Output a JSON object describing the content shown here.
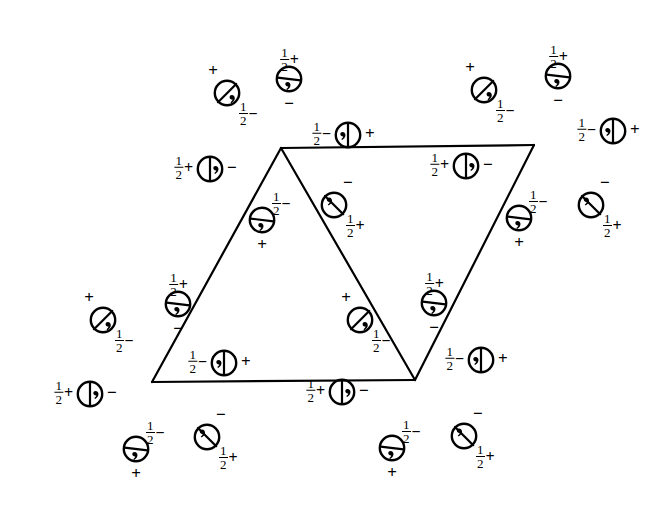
{
  "figure": {
    "kind": "crystallographic-space-group-general-position-diagram",
    "background_color": "#ffffff",
    "ink_color": "#000000",
    "cell_outline": {
      "shape": "two-triangles-forming-rhombus",
      "stroke_width": 2.2,
      "vertices": {
        "top_left": {
          "x": 281,
          "y": 148
        },
        "top_right": {
          "x": 534,
          "y": 145
        },
        "bottom_left": {
          "x": 152,
          "y": 382
        },
        "bottom_mid": {
          "x": 415,
          "y": 380
        }
      },
      "edges": [
        {
          "name": "top-edge",
          "from": "top_left",
          "to": "top_right"
        },
        {
          "name": "left-edge",
          "from": "top_left",
          "to": "bottom_left"
        },
        {
          "name": "bottom-edge",
          "from": "bottom_left",
          "to": "bottom_mid"
        },
        {
          "name": "inner-diagonal",
          "from": "top_left",
          "to": "bottom_mid"
        },
        {
          "name": "right-edge",
          "from": "top_right",
          "to": "bottom_mid"
        }
      ]
    },
    "glyph_legend": {
      "circle-split-vertical-comma-right": "circle divided by a vertical chord, comma mark in right half",
      "circle-split-vertical-comma-left": "circle divided by a vertical chord, comma mark in left half",
      "circle-split-horizontal-comma-below": "circle divided by a horizontal chord, comma mark below the chord",
      "circle-split-diagonal-nesw-comma-lower-right": "circle divided by a diagonal chord running upper-right to lower-left, comma in lower-right",
      "circle-split-diagonal-nwse-comma-upper-left": "circle divided by a diagonal chord running upper-left to lower-right, comma in upper-left"
    },
    "labels": {
      "plus": "+",
      "minus": "−",
      "half_numerator": "1",
      "half_denominator": "2",
      "half_plus_suffix": "+",
      "half_minus_suffix": "−"
    },
    "sites": [
      {
        "id": "s01",
        "x": 289,
        "y": 79,
        "glyph": "circle-split-horizontal-comma-below",
        "marks": [
          {
            "pos": "n",
            "type": "half-plus"
          },
          {
            "pos": "s",
            "type": "minus"
          }
        ]
      },
      {
        "id": "s02",
        "x": 227,
        "y": 93,
        "glyph": "circle-split-diagonal-nesw-comma-lower-right",
        "marks": [
          {
            "pos": "nw",
            "type": "plus"
          },
          {
            "pos": "se",
            "type": "half-minus"
          }
        ]
      },
      {
        "id": "s03",
        "x": 558,
        "y": 76,
        "glyph": "circle-split-horizontal-comma-below",
        "marks": [
          {
            "pos": "n",
            "type": "half-plus"
          },
          {
            "pos": "s",
            "type": "minus"
          }
        ]
      },
      {
        "id": "s04",
        "x": 484,
        "y": 90,
        "glyph": "circle-split-diagonal-nesw-comma-lower-right",
        "marks": [
          {
            "pos": "nw",
            "type": "plus"
          },
          {
            "pos": "se",
            "type": "half-minus"
          }
        ]
      },
      {
        "id": "s05",
        "x": 348,
        "y": 135,
        "glyph": "circle-split-vertical-comma-left",
        "marks": [
          {
            "pos": "w",
            "type": "half-minus"
          },
          {
            "pos": "e",
            "type": "plus"
          }
        ]
      },
      {
        "id": "s06",
        "x": 613,
        "y": 131,
        "glyph": "circle-split-vertical-comma-left",
        "marks": [
          {
            "pos": "w",
            "type": "half-minus"
          },
          {
            "pos": "e",
            "type": "plus"
          }
        ]
      },
      {
        "id": "s07",
        "x": 210,
        "y": 169,
        "glyph": "circle-split-vertical-comma-right",
        "marks": [
          {
            "pos": "w",
            "type": "half-plus"
          },
          {
            "pos": "e",
            "type": "minus"
          }
        ]
      },
      {
        "id": "s08",
        "x": 466,
        "y": 166,
        "glyph": "circle-split-vertical-comma-right",
        "marks": [
          {
            "pos": "w",
            "type": "half-plus"
          },
          {
            "pos": "e",
            "type": "minus"
          }
        ]
      },
      {
        "id": "s09",
        "x": 262,
        "y": 220,
        "glyph": "circle-split-horizontal-comma-below",
        "marks": [
          {
            "pos": "ne",
            "type": "half-minus"
          },
          {
            "pos": "s",
            "type": "plus"
          }
        ]
      },
      {
        "id": "s10",
        "x": 334,
        "y": 205,
        "glyph": "circle-split-diagonal-nwse-comma-upper-left",
        "marks": [
          {
            "pos": "ne",
            "type": "minus"
          },
          {
            "pos": "se",
            "type": "half-plus"
          }
        ]
      },
      {
        "id": "s11",
        "x": 519,
        "y": 218,
        "glyph": "circle-split-horizontal-comma-below",
        "marks": [
          {
            "pos": "ne",
            "type": "half-minus"
          },
          {
            "pos": "s",
            "type": "plus"
          }
        ]
      },
      {
        "id": "s12",
        "x": 591,
        "y": 205,
        "glyph": "circle-split-diagonal-nwse-comma-upper-left",
        "marks": [
          {
            "pos": "ne",
            "type": "minus"
          },
          {
            "pos": "se",
            "type": "half-plus"
          }
        ]
      },
      {
        "id": "s13",
        "x": 178,
        "y": 304,
        "glyph": "circle-split-horizontal-comma-below",
        "marks": [
          {
            "pos": "n",
            "type": "half-plus"
          },
          {
            "pos": "s",
            "type": "minus"
          }
        ]
      },
      {
        "id": "s14",
        "x": 103,
        "y": 320,
        "glyph": "circle-split-diagonal-nesw-comma-lower-right",
        "marks": [
          {
            "pos": "nw",
            "type": "plus"
          },
          {
            "pos": "se",
            "type": "half-minus"
          }
        ]
      },
      {
        "id": "s15",
        "x": 434,
        "y": 303,
        "glyph": "circle-split-horizontal-comma-below",
        "marks": [
          {
            "pos": "n",
            "type": "half-plus"
          },
          {
            "pos": "s",
            "type": "minus"
          }
        ]
      },
      {
        "id": "s16",
        "x": 360,
        "y": 320,
        "glyph": "circle-split-diagonal-nesw-comma-lower-right",
        "marks": [
          {
            "pos": "nw",
            "type": "plus"
          },
          {
            "pos": "se",
            "type": "half-minus"
          }
        ]
      },
      {
        "id": "s17",
        "x": 224,
        "y": 363,
        "glyph": "circle-split-vertical-comma-left",
        "marks": [
          {
            "pos": "w",
            "type": "half-minus"
          },
          {
            "pos": "e",
            "type": "plus"
          }
        ]
      },
      {
        "id": "s18",
        "x": 481,
        "y": 360,
        "glyph": "circle-split-vertical-comma-left",
        "marks": [
          {
            "pos": "w",
            "type": "half-minus"
          },
          {
            "pos": "e",
            "type": "plus"
          }
        ]
      },
      {
        "id": "s19",
        "x": 90,
        "y": 394,
        "glyph": "circle-split-vertical-comma-right",
        "marks": [
          {
            "pos": "w",
            "type": "half-plus"
          },
          {
            "pos": "e",
            "type": "minus"
          }
        ]
      },
      {
        "id": "s20",
        "x": 342,
        "y": 392,
        "glyph": "circle-split-vertical-comma-right",
        "marks": [
          {
            "pos": "w",
            "type": "half-plus"
          },
          {
            "pos": "e",
            "type": "minus"
          }
        ]
      },
      {
        "id": "s21",
        "x": 136,
        "y": 449,
        "glyph": "circle-split-horizontal-comma-below",
        "marks": [
          {
            "pos": "ne",
            "type": "half-minus"
          },
          {
            "pos": "s",
            "type": "plus"
          }
        ]
      },
      {
        "id": "s22",
        "x": 207,
        "y": 437,
        "glyph": "circle-split-diagonal-nwse-comma-upper-left",
        "marks": [
          {
            "pos": "ne",
            "type": "minus"
          },
          {
            "pos": "se",
            "type": "half-plus"
          }
        ]
      },
      {
        "id": "s23",
        "x": 392,
        "y": 448,
        "glyph": "circle-split-horizontal-comma-below",
        "marks": [
          {
            "pos": "ne",
            "type": "half-minus"
          },
          {
            "pos": "s",
            "type": "plus"
          }
        ]
      },
      {
        "id": "s24",
        "x": 464,
        "y": 436,
        "glyph": "circle-split-diagonal-nwse-comma-upper-left",
        "marks": [
          {
            "pos": "ne",
            "type": "minus"
          },
          {
            "pos": "se",
            "type": "half-plus"
          }
        ]
      }
    ]
  }
}
